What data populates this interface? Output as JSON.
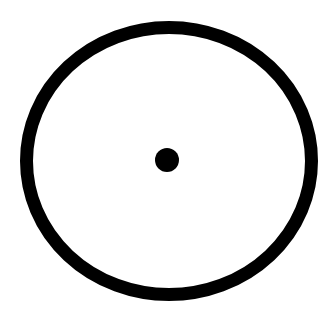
{
  "diagram": {
    "background": "#ffffff",
    "outer_circle": {
      "cx": 169,
      "cy": 161,
      "rx": 142.5,
      "ry": 133.5,
      "stroke": "#000000",
      "stroke_width": 13,
      "fill": "none"
    },
    "center_dot": {
      "cx": 167,
      "cy": 160,
      "r": 12,
      "fill": "#000000"
    }
  }
}
